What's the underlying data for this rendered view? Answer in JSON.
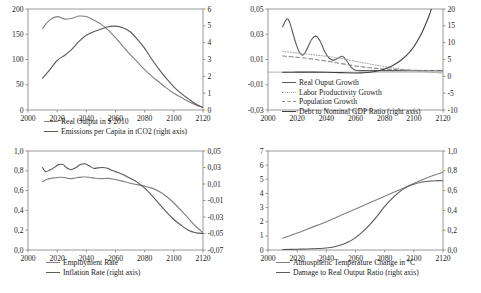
{
  "figure": {
    "panel_count": 4,
    "colors": {
      "series_a": "#7f7f7f",
      "series_b": "#595959",
      "series_c": "#a6a6a6",
      "series_d": "#404040",
      "axis": "#808080",
      "text": "#1a1a1a",
      "background": "#ffffff"
    }
  },
  "chart_data": [
    {
      "id": "top-left",
      "type": "line",
      "title": "",
      "xlabel": "",
      "ylabel": "",
      "grid": false,
      "legend_position": "bottom",
      "xlim": [
        2000,
        2120
      ],
      "xticks": [
        "2000",
        "2020",
        "2040",
        "2060",
        "2080",
        "2100",
        "2120"
      ],
      "xtick_values": [
        2000,
        2020,
        2040,
        2060,
        2080,
        2100,
        2120
      ],
      "ylim": [
        0,
        200
      ],
      "yticks": [
        "0",
        "50",
        "100",
        "150",
        "200"
      ],
      "ytick_values": [
        0,
        50,
        100,
        150,
        200
      ],
      "y2lim": [
        0,
        6
      ],
      "y2ticks": [
        "0",
        "1",
        "2",
        "3",
        "4",
        "5",
        "6"
      ],
      "y2tick_values": [
        0,
        1,
        2,
        3,
        4,
        5,
        6
      ],
      "series": [
        {
          "name": "Real Output in $ 2010",
          "axis": "right",
          "style": "solid",
          "color": "#7f7f7f",
          "x": [
            2010,
            2015,
            2020,
            2025,
            2030,
            2035,
            2040,
            2045,
            2050,
            2055,
            2060,
            2065,
            2070,
            2075,
            2080,
            2085,
            2090,
            2095,
            2100,
            2105,
            2110,
            2115,
            2120
          ],
          "values": [
            4.85,
            5.35,
            5.55,
            5.4,
            5.45,
            5.58,
            5.55,
            5.35,
            5.1,
            4.75,
            4.3,
            3.8,
            3.3,
            2.85,
            2.4,
            2.0,
            1.65,
            1.3,
            1.0,
            0.75,
            0.5,
            0.3,
            0.15
          ]
        },
        {
          "name": "Emissions per Capita in tCO2 (right axis)",
          "axis": "left",
          "style": "solid",
          "color": "#595959",
          "x": [
            2010,
            2015,
            2020,
            2025,
            2030,
            2035,
            2040,
            2045,
            2050,
            2055,
            2060,
            2065,
            2070,
            2075,
            2080,
            2085,
            2090,
            2095,
            2100,
            2105,
            2110,
            2115,
            2120
          ],
          "values": [
            63,
            80,
            98,
            108,
            120,
            136,
            148,
            155,
            160,
            165,
            166,
            163,
            155,
            140,
            122,
            100,
            80,
            62,
            46,
            33,
            22,
            12,
            5
          ]
        }
      ],
      "legend": [
        {
          "label": "Real Output in $ 2010",
          "style": "solid",
          "color": "#7f7f7f"
        },
        {
          "label": "Emissions per Capita in tCO2 (right axis)",
          "style": "solid",
          "color": "#595959"
        }
      ]
    },
    {
      "id": "top-right",
      "type": "line",
      "title": "",
      "xlabel": "",
      "ylabel": "",
      "grid": false,
      "legend_position": "inside-bottom-left",
      "xlim": [
        2000,
        2120
      ],
      "xticks": [
        "2000",
        "2020",
        "2040",
        "2060",
        "2080",
        "2100",
        "2120"
      ],
      "xtick_values": [
        2000,
        2020,
        2040,
        2060,
        2080,
        2100,
        2120
      ],
      "ylim": [
        -0.03,
        0.05
      ],
      "yticks": [
        "0,05",
        "0,03",
        "0,01",
        "-0,01",
        "-0,03"
      ],
      "ytick_values": [
        0.05,
        0.03,
        0.01,
        -0.01,
        -0.03
      ],
      "y2lim": [
        -10,
        20
      ],
      "y2ticks": [
        "20",
        "15",
        "10",
        "5",
        "0",
        "-5",
        "-10"
      ],
      "y2tick_values": [
        20,
        15,
        10,
        5,
        0,
        -5,
        -10
      ],
      "series": [
        {
          "name": "Real Ouput Growth",
          "axis": "left",
          "style": "solid",
          "color": "#595959",
          "x": [
            2010,
            2013,
            2015,
            2018,
            2021,
            2024,
            2027,
            2030,
            2033,
            2036,
            2039,
            2042,
            2045,
            2048,
            2051,
            2054,
            2057,
            2060,
            2065,
            2070,
            2080,
            2090,
            2100,
            2110,
            2120
          ],
          "values": [
            0.036,
            0.042,
            0.039,
            0.027,
            0.017,
            0.0135,
            0.019,
            0.026,
            0.0285,
            0.024,
            0.016,
            0.011,
            0.0095,
            0.011,
            0.0125,
            0.009,
            0.004,
            0.0015,
            0.0012,
            0.0012,
            0.0012,
            0.0012,
            0.0012,
            0.0012,
            0.0012
          ]
        },
        {
          "name": "Labor Productivity Growth",
          "axis": "left",
          "style": "dotted",
          "color": "#a6a6a6",
          "x": [
            2010,
            2020,
            2030,
            2040,
            2050,
            2060,
            2070,
            2080,
            2090,
            2100,
            2110,
            2120
          ],
          "values": [
            0.0165,
            0.0152,
            0.0139,
            0.0125,
            0.0108,
            0.0086,
            0.0064,
            0.0044,
            0.0026,
            0.0012,
            0.0001,
            -0.0008
          ]
        },
        {
          "name": "Population Growth",
          "axis": "left",
          "style": "dashed",
          "color": "#8c8c8c",
          "x": [
            2010,
            2020,
            2030,
            2040,
            2050,
            2060,
            2070,
            2080,
            2090,
            2100,
            2110,
            2120
          ],
          "values": [
            0.0128,
            0.0118,
            0.0104,
            0.0088,
            0.0068,
            0.0049,
            0.0035,
            0.0025,
            0.0019,
            0.0015,
            0.0013,
            0.0012
          ]
        },
        {
          "name": "Debt to Nominal GDP Ratio (right axis)",
          "axis": "right",
          "style": "solid",
          "color": "#404040",
          "x": [
            2010,
            2020,
            2030,
            2040,
            2050,
            2060,
            2065,
            2070,
            2075,
            2080,
            2085,
            2090,
            2095,
            2100,
            2105,
            2110,
            2112
          ],
          "values": [
            1.2,
            1.25,
            1.25,
            1.2,
            1.1,
            1.0,
            1.05,
            1.2,
            1.6,
            2.2,
            3.1,
            4.4,
            6.2,
            8.8,
            12.5,
            17.5,
            20.0
          ]
        }
      ],
      "legend": [
        {
          "label": "Real Ouput Growth",
          "style": "solid",
          "color": "#595959"
        },
        {
          "label": "Labor Productivity Growth",
          "style": "dotted",
          "color": "#a6a6a6"
        },
        {
          "label": "Population Growth",
          "style": "dashed",
          "color": "#8c8c8c"
        },
        {
          "label": "Debt to Nominal GDP Ratio (right axis)",
          "style": "solid",
          "color": "#404040"
        }
      ]
    },
    {
      "id": "bottom-left",
      "type": "line",
      "title": "",
      "xlabel": "",
      "ylabel": "",
      "grid": false,
      "legend_position": "bottom",
      "xlim": [
        2000,
        2120
      ],
      "xticks": [
        "2000",
        "2020",
        "2040",
        "2060",
        "2080",
        "2100",
        "2120"
      ],
      "xtick_values": [
        2000,
        2020,
        2040,
        2060,
        2080,
        2100,
        2120
      ],
      "ylim": [
        0.0,
        1.0
      ],
      "yticks": [
        "1,0",
        "0,8",
        "0,6",
        "0,4",
        "0,2",
        "0,0"
      ],
      "ytick_values": [
        1.0,
        0.8,
        0.6,
        0.4,
        0.2,
        0.0
      ],
      "y2lim": [
        -0.07,
        0.05
      ],
      "y2ticks": [
        "0,05",
        "0,03",
        "0,01",
        "-0,01",
        "-0,03",
        "-0,05",
        "-0,07"
      ],
      "y2tick_values": [
        0.05,
        0.03,
        0.01,
        -0.01,
        -0.03,
        -0.05,
        -0.07
      ],
      "series": [
        {
          "name": "Employment Rate",
          "axis": "left",
          "style": "solid",
          "color": "#7f7f7f",
          "x": [
            2010,
            2013,
            2016,
            2019,
            2022,
            2025,
            2028,
            2031,
            2034,
            2037,
            2040,
            2043,
            2046,
            2049,
            2052,
            2055,
            2058,
            2061,
            2064,
            2070,
            2075,
            2080,
            2085,
            2090,
            2095,
            2100,
            2105,
            2110,
            2115,
            2120
          ],
          "values": [
            0.69,
            0.715,
            0.725,
            0.73,
            0.735,
            0.733,
            0.722,
            0.723,
            0.732,
            0.736,
            0.738,
            0.733,
            0.724,
            0.72,
            0.722,
            0.723,
            0.718,
            0.708,
            0.698,
            0.675,
            0.66,
            0.645,
            0.625,
            0.59,
            0.54,
            0.475,
            0.4,
            0.32,
            0.24,
            0.175
          ]
        },
        {
          "name": "Inflation Rate (right axis)",
          "axis": "right",
          "style": "solid",
          "color": "#595959",
          "x": [
            2010,
            2012,
            2015,
            2018,
            2021,
            2024,
            2027,
            2030,
            2033,
            2036,
            2039,
            2042,
            2045,
            2048,
            2051,
            2054,
            2057,
            2060,
            2065,
            2070,
            2075,
            2080,
            2085,
            2090,
            2095,
            2100,
            2105,
            2110,
            2115,
            2120
          ],
          "values": [
            0.03,
            0.025,
            0.027,
            0.03,
            0.0335,
            0.0335,
            0.029,
            0.0275,
            0.03,
            0.0335,
            0.0345,
            0.032,
            0.029,
            0.0295,
            0.03,
            0.0295,
            0.027,
            0.025,
            0.0215,
            0.017,
            0.012,
            0.005,
            -0.004,
            -0.014,
            -0.024,
            -0.033,
            -0.04,
            -0.046,
            -0.049,
            -0.05
          ]
        }
      ],
      "legend": [
        {
          "label": "Employment Rate",
          "style": "solid",
          "color": "#7f7f7f"
        },
        {
          "label": "Inflation Rate (right axis)",
          "style": "solid",
          "color": "#595959"
        }
      ]
    },
    {
      "id": "bottom-right",
      "type": "line",
      "title": "",
      "xlabel": "",
      "ylabel": "",
      "grid": false,
      "legend_position": "bottom",
      "xlim": [
        2000,
        2120
      ],
      "xticks": [
        "2000",
        "2020",
        "2040",
        "2060",
        "2080",
        "2100",
        "2120"
      ],
      "xtick_values": [
        2000,
        2020,
        2040,
        2060,
        2080,
        2100,
        2120
      ],
      "ylim": [
        0,
        7
      ],
      "yticks": [
        "7",
        "6",
        "5",
        "4",
        "3",
        "2",
        "1",
        "0"
      ],
      "ytick_values": [
        7,
        6,
        5,
        4,
        3,
        2,
        1,
        0
      ],
      "y2lim": [
        0.0,
        1.0
      ],
      "y2ticks": [
        "1,0",
        "0,8",
        "0,6",
        "0,4",
        "0,2",
        "0,0"
      ],
      "y2tick_values": [
        1.0,
        0.8,
        0.6,
        0.4,
        0.2,
        0.0
      ],
      "series": [
        {
          "name": "Atmospheric Temperature Change in °C",
          "axis": "left",
          "style": "solid",
          "color": "#7f7f7f",
          "x": [
            2010,
            2020,
            2030,
            2040,
            2050,
            2060,
            2070,
            2080,
            2090,
            2100,
            2110,
            2120
          ],
          "values": [
            0.83,
            1.2,
            1.6,
            2.0,
            2.45,
            2.9,
            3.35,
            3.8,
            4.25,
            4.7,
            5.15,
            5.5
          ]
        },
        {
          "name": "Damage to Real Output Ratio  (right axis)",
          "axis": "right",
          "style": "solid",
          "color": "#595959",
          "x": [
            2010,
            2020,
            2030,
            2040,
            2045,
            2050,
            2055,
            2060,
            2065,
            2070,
            2075,
            2080,
            2085,
            2090,
            2095,
            2100,
            2105,
            2110,
            2115,
            2120
          ],
          "values": [
            0.005,
            0.008,
            0.012,
            0.02,
            0.03,
            0.05,
            0.08,
            0.125,
            0.185,
            0.26,
            0.345,
            0.44,
            0.52,
            0.585,
            0.635,
            0.665,
            0.685,
            0.695,
            0.7,
            0.7
          ]
        }
      ],
      "legend": [
        {
          "label": "Atmospheric Temperature Change in °C",
          "style": "solid",
          "color": "#7f7f7f"
        },
        {
          "label": "Damage to Real Output Ratio  (right axis)",
          "style": "solid",
          "color": "#595959"
        }
      ]
    }
  ]
}
